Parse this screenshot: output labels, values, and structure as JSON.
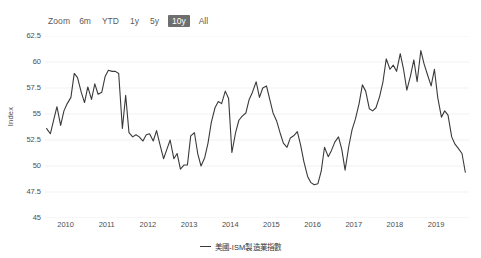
{
  "zoom_controls": {
    "label": "Zoom",
    "buttons": [
      {
        "label": "6m",
        "active": false
      },
      {
        "label": "YTD",
        "active": false
      },
      {
        "label": "1y",
        "active": false
      },
      {
        "label": "5y",
        "active": false
      },
      {
        "label": "10y",
        "active": true
      },
      {
        "label": "All",
        "active": false
      }
    ],
    "active_color": "#6e6e6e",
    "active_text_color": "#ffffff"
  },
  "chart_data": {
    "type": "line",
    "title": "",
    "subtitle": "",
    "xlabel": "",
    "ylabel": "Index",
    "ylim": [
      45,
      62.5
    ],
    "yticks": [
      45,
      47.5,
      50,
      52.5,
      55,
      57.5,
      60,
      62.5
    ],
    "ytick_labels": [
      "45",
      "47.5",
      "50",
      "52.5",
      "55",
      "57.5",
      "60",
      "62.5"
    ],
    "xlim": [
      2009.5,
      2019.8
    ],
    "xticks": [
      2010,
      2011,
      2012,
      2013,
      2014,
      2015,
      2016,
      2017,
      2018,
      2019
    ],
    "xtick_labels": [
      "2010",
      "2011",
      "2012",
      "2013",
      "2014",
      "2015",
      "2016",
      "2017",
      "2018",
      "2019"
    ],
    "grid": true,
    "grid_color": "#ededed",
    "legend_position": "bottom",
    "line_color": "#3a3a3a",
    "line_width": 1.1,
    "series": [
      {
        "name": "美國-ISM製造業指數",
        "color": "#3a3a3a",
        "x": [
          2009.54,
          2009.63,
          2009.71,
          2009.79,
          2009.88,
          2009.96,
          2010.04,
          2010.13,
          2010.21,
          2010.29,
          2010.38,
          2010.46,
          2010.54,
          2010.63,
          2010.71,
          2010.79,
          2010.88,
          2010.96,
          2011.04,
          2011.13,
          2011.21,
          2011.29,
          2011.38,
          2011.46,
          2011.54,
          2011.63,
          2011.71,
          2011.79,
          2011.88,
          2011.96,
          2012.04,
          2012.13,
          2012.21,
          2012.29,
          2012.38,
          2012.46,
          2012.54,
          2012.63,
          2012.71,
          2012.79,
          2012.88,
          2012.96,
          2013.04,
          2013.13,
          2013.21,
          2013.29,
          2013.38,
          2013.46,
          2013.54,
          2013.63,
          2013.71,
          2013.79,
          2013.88,
          2013.96,
          2014.04,
          2014.13,
          2014.21,
          2014.29,
          2014.38,
          2014.46,
          2014.54,
          2014.63,
          2014.71,
          2014.79,
          2014.88,
          2014.96,
          2015.04,
          2015.13,
          2015.21,
          2015.29,
          2015.38,
          2015.46,
          2015.54,
          2015.63,
          2015.71,
          2015.79,
          2015.88,
          2015.96,
          2016.04,
          2016.13,
          2016.21,
          2016.29,
          2016.38,
          2016.46,
          2016.54,
          2016.63,
          2016.71,
          2016.79,
          2016.88,
          2016.96,
          2017.04,
          2017.13,
          2017.21,
          2017.29,
          2017.38,
          2017.46,
          2017.54,
          2017.63,
          2017.71,
          2017.79,
          2017.88,
          2017.96,
          2018.04,
          2018.13,
          2018.21,
          2018.29,
          2018.38,
          2018.46,
          2018.54,
          2018.63,
          2018.71,
          2018.79,
          2018.88,
          2018.96,
          2019.04,
          2019.13,
          2019.21,
          2019.29,
          2019.38,
          2019.46,
          2019.54,
          2019.63,
          2019.71
        ],
        "values": [
          53.6,
          53.1,
          54.4,
          55.7,
          53.9,
          55.3,
          56.0,
          56.6,
          58.9,
          58.5,
          57.1,
          56.1,
          57.6,
          56.4,
          57.9,
          56.9,
          57.1,
          58.6,
          59.2,
          59.1,
          59.1,
          58.9,
          53.6,
          56.8,
          53.2,
          52.8,
          53.0,
          52.8,
          52.4,
          53.0,
          53.1,
          52.4,
          53.4,
          52.1,
          50.7,
          51.6,
          52.5,
          50.7,
          51.2,
          49.7,
          50.1,
          50.1,
          52.9,
          53.2,
          51.2,
          50.0,
          50.8,
          52.2,
          54.2,
          55.6,
          56.2,
          56.0,
          57.2,
          56.5,
          51.3,
          53.2,
          54.4,
          54.8,
          55.1,
          56.4,
          57.1,
          58.1,
          56.6,
          57.5,
          57.7,
          56.4,
          55.1,
          54.3,
          53.2,
          52.2,
          51.8,
          52.7,
          52.9,
          53.3,
          52.0,
          50.4,
          49.0,
          48.4,
          48.2,
          48.3,
          49.5,
          51.8,
          50.9,
          51.5,
          52.3,
          52.8,
          51.6,
          49.6,
          51.9,
          53.5,
          54.5,
          56.0,
          57.8,
          57.2,
          55.5,
          55.3,
          55.6,
          56.7,
          58.1,
          60.3,
          59.3,
          59.7,
          59.1,
          60.8,
          59.3,
          57.3,
          58.7,
          60.2,
          58.1,
          61.1,
          59.8,
          58.8,
          57.7,
          59.3,
          56.6,
          54.7,
          55.3,
          54.9,
          52.8,
          52.1,
          51.7,
          51.2,
          49.4
        ]
      }
    ]
  },
  "legend": {
    "series_label": "美國-ISM製造業指數"
  }
}
